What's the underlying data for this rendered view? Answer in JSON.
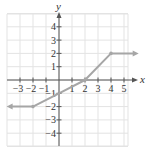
{
  "chart_data": {
    "type": "line",
    "title": "",
    "xlabel": "x",
    "ylabel": "y",
    "xlim": [
      -4,
      5.5
    ],
    "ylim": [
      -5,
      5
    ],
    "grid": true,
    "x_ticks": [
      -3,
      -2,
      -1,
      1,
      2,
      3,
      4,
      5
    ],
    "y_ticks": [
      -4,
      -3,
      -2,
      -1,
      1,
      2,
      3,
      4
    ],
    "x_tick_labels": [
      "−3",
      "−2",
      "−1",
      "1",
      "2",
      "3",
      "4",
      "5"
    ],
    "y_tick_labels": [
      "−4",
      "−3",
      "−2",
      "−1",
      "1",
      "2",
      "3",
      "4"
    ],
    "series": [
      {
        "name": "piecewise function",
        "points": [
          {
            "x": -3.8,
            "y": -2,
            "arrow": true
          },
          {
            "x": -2,
            "y": -2,
            "dot": true
          },
          {
            "x": 0,
            "y": -1
          },
          {
            "x": 2,
            "y": 0,
            "dot": true
          },
          {
            "x": 4,
            "y": 2,
            "dot": true
          },
          {
            "x": 5.9,
            "y": 2,
            "arrow": true
          }
        ],
        "color": "#a6a6a6"
      }
    ]
  },
  "colors": {
    "grid": "#e3e3e3",
    "axis": "#555555",
    "curve": "#a6a6a6",
    "text": "#333333"
  },
  "axes": {
    "x_label": "x",
    "y_label": "y"
  }
}
